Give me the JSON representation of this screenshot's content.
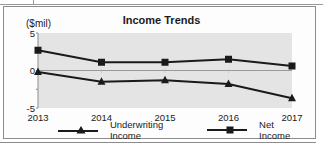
{
  "chart_data": {
    "type": "line",
    "title": "Income Trends",
    "ylabel": "($mil)",
    "xlabel": "",
    "categories": [
      "2013",
      "2014",
      "2015",
      "2016",
      "2017"
    ],
    "series": [
      {
        "name": "Underwriting Income",
        "marker": "triangle",
        "values": [
          -0.2,
          -1.5,
          -1.3,
          -1.8,
          -3.7
        ]
      },
      {
        "name": "Net Income",
        "marker": "square",
        "values": [
          2.7,
          1.1,
          1.1,
          1.5,
          0.6
        ]
      }
    ],
    "ylim": [
      -5,
      5
    ],
    "yticks": [
      "5",
      "0",
      "-5"
    ],
    "grid": false,
    "zero_line": true,
    "legend_position": "bottom",
    "colors": {
      "plot_bg": "#e4e4e4",
      "line": "#1a1a1a",
      "zero_line": "#9a9a9a"
    }
  },
  "legend": {
    "items": [
      "Underwriting Income",
      "Net Income"
    ]
  }
}
